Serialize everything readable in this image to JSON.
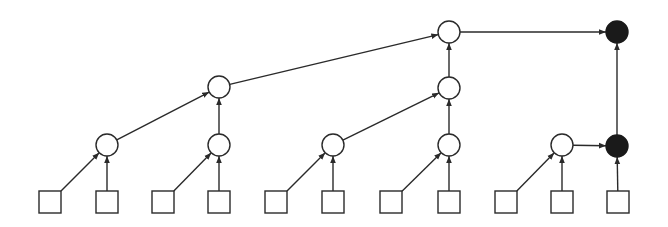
{
  "diagram": {
    "title": "",
    "colors": {
      "stroke": "#2a2a2a",
      "filled_node": "#1a1a1a",
      "open_node": "#ffffff",
      "background": "#ffffff"
    },
    "nodes": [
      {
        "id": "L1",
        "kind": "leaf"
      },
      {
        "id": "L2",
        "kind": "leaf"
      },
      {
        "id": "L3",
        "kind": "leaf"
      },
      {
        "id": "L4",
        "kind": "leaf"
      },
      {
        "id": "L5",
        "kind": "leaf"
      },
      {
        "id": "L6",
        "kind": "leaf"
      },
      {
        "id": "L7",
        "kind": "leaf"
      },
      {
        "id": "L8",
        "kind": "leaf"
      },
      {
        "id": "L9",
        "kind": "leaf"
      },
      {
        "id": "L10",
        "kind": "leaf"
      },
      {
        "id": "L11",
        "kind": "leaf"
      },
      {
        "id": "A1",
        "kind": "open"
      },
      {
        "id": "A2",
        "kind": "open"
      },
      {
        "id": "A3",
        "kind": "open"
      },
      {
        "id": "A4",
        "kind": "open"
      },
      {
        "id": "A5",
        "kind": "open"
      },
      {
        "id": "F1",
        "kind": "filled"
      },
      {
        "id": "B1",
        "kind": "open"
      },
      {
        "id": "B2",
        "kind": "open"
      },
      {
        "id": "C1",
        "kind": "open"
      },
      {
        "id": "F2",
        "kind": "filled"
      }
    ],
    "edges": [
      {
        "from": "L1",
        "to": "A1"
      },
      {
        "from": "L2",
        "to": "A1"
      },
      {
        "from": "L3",
        "to": "A2"
      },
      {
        "from": "L4",
        "to": "A2"
      },
      {
        "from": "L5",
        "to": "A3"
      },
      {
        "from": "L6",
        "to": "A3"
      },
      {
        "from": "L7",
        "to": "A4"
      },
      {
        "from": "L8",
        "to": "A4"
      },
      {
        "from": "L9",
        "to": "A5"
      },
      {
        "from": "L10",
        "to": "A5"
      },
      {
        "from": "L11",
        "to": "F1"
      },
      {
        "from": "A5",
        "to": "F1"
      },
      {
        "from": "A1",
        "to": "B1"
      },
      {
        "from": "A2",
        "to": "B1"
      },
      {
        "from": "A3",
        "to": "B2"
      },
      {
        "from": "A4",
        "to": "B2"
      },
      {
        "from": "B1",
        "to": "C1"
      },
      {
        "from": "B2",
        "to": "C1"
      },
      {
        "from": "C1",
        "to": "F2"
      },
      {
        "from": "F1",
        "to": "F2"
      }
    ]
  }
}
